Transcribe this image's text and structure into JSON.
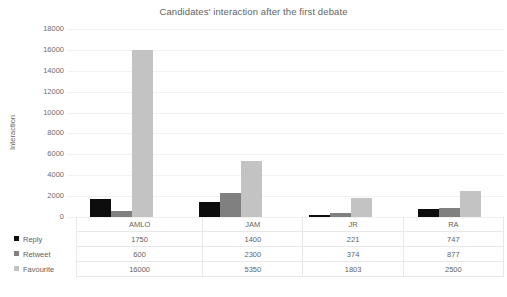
{
  "chart_data": {
    "type": "bar",
    "title": "Candidates' interaction after the first debate",
    "xlabel": "",
    "ylabel": "Interaction",
    "categories": [
      "AMLO",
      "JAM",
      "JR",
      "RA"
    ],
    "series": [
      {
        "name": "Reply",
        "color": "#0d0d0d",
        "values": [
          1750,
          1400,
          221,
          747
        ]
      },
      {
        "name": "Retweet",
        "color": "#808080",
        "values": [
          600,
          2300,
          374,
          877
        ]
      },
      {
        "name": "Favourite",
        "color": "#c3c3c3",
        "values": [
          16000,
          5350,
          1803,
          2500
        ]
      }
    ],
    "ylim": [
      0,
      18000
    ],
    "ytick_step": 2000,
    "yticks": [
      "18000",
      "16000",
      "14000",
      "12000",
      "10000",
      "8000",
      "6000",
      "4000",
      "2000",
      "0"
    ],
    "grid": true,
    "gridline_color": "#f2f2f2",
    "legend_position": "data-table-left",
    "has_data_table": true,
    "background": "#ffffff"
  }
}
